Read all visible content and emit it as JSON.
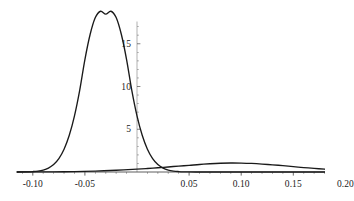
{
  "chart_data": {
    "type": "line",
    "title": "",
    "subtitle": "",
    "xlabel": "",
    "ylabel": "",
    "xlim": [
      -0.115,
      0.205
    ],
    "ylim": [
      0,
      19.8
    ],
    "grid": false,
    "legend": "none",
    "axes": {
      "x_axis_at_y": 0,
      "y_axis_at_x": 0,
      "x_ticks": [
        -0.1,
        -0.05,
        0.05,
        0.1,
        0.15,
        0.2
      ],
      "x_tick_labels": [
        "-0.10",
        "-0.05",
        "0.05",
        "0.10",
        "0.15",
        "0.20"
      ],
      "y_ticks": [
        5,
        10,
        15
      ],
      "y_tick_labels": [
        "5",
        "10",
        "15"
      ],
      "x_minor_tick_count": 4,
      "y_minor_tick_count": 4,
      "axis_color": "#4d4d4d",
      "curve_color": "#1a1a1a"
    },
    "series": [
      {
        "name": "narrow-peak-density",
        "description": "tall narrow unimodal density peaking near x = -0.025",
        "peak_x": -0.025,
        "peak_y": 18.8,
        "mean": -0.025,
        "sigma": 0.0212,
        "amplitude": 18.8,
        "x": [
          -0.115,
          -0.11,
          -0.105,
          -0.1,
          -0.095,
          -0.09,
          -0.085,
          -0.08,
          -0.075,
          -0.07,
          -0.065,
          -0.06,
          -0.055,
          -0.05,
          -0.045,
          -0.04,
          -0.035,
          -0.03,
          -0.025,
          -0.02,
          -0.015,
          -0.01,
          -0.005,
          0.0,
          0.005,
          0.01,
          0.015,
          0.02,
          0.025,
          0.03,
          0.035,
          0.04,
          0.045,
          0.05,
          0.06,
          0.07,
          0.08,
          0.1,
          0.12,
          0.15,
          0.18,
          0.205
        ],
        "values": [
          0.0,
          0.01,
          0.02,
          0.05,
          0.11,
          0.23,
          0.46,
          0.87,
          1.56,
          2.66,
          4.29,
          6.57,
          9.55,
          13.15,
          16.08,
          18.06,
          18.8,
          18.46,
          18.8,
          18.06,
          16.08,
          13.15,
          9.55,
          6.57,
          4.29,
          2.66,
          1.56,
          0.87,
          0.46,
          0.23,
          0.11,
          0.05,
          0.02,
          0.01,
          0.0,
          0.0,
          0.0,
          0.0,
          0.0,
          0.0,
          0.0,
          0.0
        ]
      },
      {
        "name": "broad-low-density",
        "description": "low broad unimodal density peaking near x = 0.09",
        "peak_x": 0.09,
        "peak_y": 1.05,
        "mean": 0.09,
        "sigma": 0.052,
        "amplitude": 1.05,
        "x": [
          -0.115,
          -0.1,
          -0.08,
          -0.06,
          -0.04,
          -0.02,
          0.0,
          0.01,
          0.02,
          0.03,
          0.04,
          0.05,
          0.06,
          0.07,
          0.08,
          0.09,
          0.1,
          0.11,
          0.12,
          0.13,
          0.14,
          0.15,
          0.16,
          0.17,
          0.18,
          0.19,
          0.2,
          0.205
        ],
        "values": [
          0.0,
          0.01,
          0.02,
          0.05,
          0.11,
          0.2,
          0.33,
          0.41,
          0.5,
          0.59,
          0.69,
          0.78,
          0.88,
          0.96,
          1.02,
          1.05,
          1.04,
          1.0,
          0.93,
          0.84,
          0.74,
          0.63,
          0.52,
          0.42,
          0.33,
          0.25,
          0.19,
          0.17
        ]
      }
    ]
  },
  "axis_labels": {
    "x": [
      {
        "text": "-0.10",
        "value": -0.1
      },
      {
        "text": "-0.05",
        "value": -0.05
      },
      {
        "text": "0.05",
        "value": 0.05
      },
      {
        "text": "0.10",
        "value": 0.1
      },
      {
        "text": "0.15",
        "value": 0.15
      },
      {
        "text": "0.20",
        "value": 0.2
      }
    ],
    "y": [
      {
        "text": "5",
        "value": 5
      },
      {
        "text": "10",
        "value": 10
      },
      {
        "text": "15",
        "value": 15
      }
    ]
  }
}
